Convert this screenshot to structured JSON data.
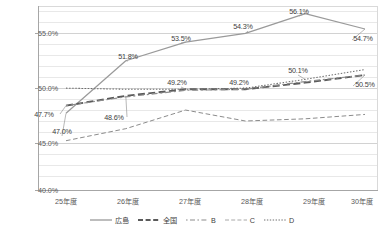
{
  "chart_data": {
    "type": "line",
    "title": "",
    "xlabel": "",
    "ylabel": "",
    "categories": [
      "25年度",
      "26年度",
      "27年度",
      "28年度",
      "29年度",
      "30年度"
    ],
    "ylim": [
      40.0,
      56.8
    ],
    "yticks": [
      "40.0%",
      "45.0%",
      "50.0%",
      "55.0%"
    ],
    "ytick_values": [
      40.0,
      45.0,
      50.0,
      55.0
    ],
    "minor_gridline_step": 1.0,
    "grid": true,
    "legend_position": "bottom",
    "series": [
      {
        "name": "広島",
        "style": "solid",
        "color": "#9a9a9a",
        "values": [
          47.0,
          51.8,
          53.5,
          54.3,
          56.1,
          54.7
        ],
        "labels": [
          "47.0%",
          "51.8%",
          "53.5%",
          "54.3%",
          "56.1%",
          "54.7%"
        ]
      },
      {
        "name": "全国",
        "style": "long-dash",
        "color": "#5a5a5a",
        "values": [
          47.7,
          48.6,
          49.2,
          49.2,
          49.8,
          50.5
        ],
        "labels": [
          "47.7%",
          "48.6%",
          "49.2%",
          "49.2%",
          "",
          "50.5%"
        ]
      },
      {
        "name": "B",
        "style": "dash-dot",
        "color": "#8c8c8c",
        "values": [
          47.7,
          48.5,
          49.1,
          49.2,
          49.9,
          50.5
        ],
        "labels": [
          "",
          "",
          "",
          "",
          "",
          ""
        ]
      },
      {
        "name": "C",
        "style": "dashed",
        "color": "#8c8c8c",
        "values": [
          44.5,
          45.6,
          47.3,
          46.3,
          46.5,
          46.9
        ],
        "labels": [
          "",
          "",
          "",
          "",
          "",
          ""
        ]
      },
      {
        "name": "D",
        "style": "dotted",
        "color": "#6e6e6e",
        "values": [
          49.3,
          49.2,
          49.2,
          49.3,
          50.1,
          51.0
        ],
        "labels": [
          "",
          "",
          "",
          "",
          "50.1%",
          ""
        ]
      }
    ],
    "annotations": [
      {
        "text": "47.0%",
        "series": "広島",
        "x": 0
      },
      {
        "text": "51.8%",
        "series": "広島",
        "x": 1
      },
      {
        "text": "53.5%",
        "series": "広島",
        "x": 2
      },
      {
        "text": "54.3%",
        "series": "広島",
        "x": 3
      },
      {
        "text": "56.1%",
        "series": "広島",
        "x": 4
      },
      {
        "text": "54.7%",
        "series": "広島",
        "x": 5
      },
      {
        "text": "47.7%",
        "series": "全国",
        "x": 0
      },
      {
        "text": "48.6%",
        "series": "全国",
        "x": 1
      },
      {
        "text": "49.2%",
        "series": "全国",
        "x": 2
      },
      {
        "text": "49.2%",
        "series": "全国",
        "x": 3
      },
      {
        "text": "50.5%",
        "series": "全国",
        "x": 5
      },
      {
        "text": "50.1%",
        "series": "D",
        "x": 4
      }
    ]
  },
  "axis": {
    "y": {
      "t0": "55.0%",
      "t1": "50.0%",
      "t2": "45.0%",
      "t3": "40.0%"
    },
    "x": {
      "t0": "25年度",
      "t1": "26年度",
      "t2": "27年度",
      "t3": "28年度",
      "t4": "29年度",
      "t5": "30年度"
    }
  },
  "labels": {
    "l_47_0": "47.0%",
    "l_51_8": "51.8%",
    "l_53_5": "53.5%",
    "l_54_3": "54.3%",
    "l_56_1": "56.1%",
    "l_54_7": "54.7%",
    "l_47_7": "47.7%",
    "l_48_6": "48.6%",
    "l_49_2_a": "49.2%",
    "l_49_2_b": "49.2%",
    "l_50_5": "50.5%",
    "l_50_1": "50.1%"
  },
  "legend": {
    "items": [
      {
        "label": "広島"
      },
      {
        "label": "全国"
      },
      {
        "label": "B"
      },
      {
        "label": "C"
      },
      {
        "label": "D"
      }
    ]
  }
}
